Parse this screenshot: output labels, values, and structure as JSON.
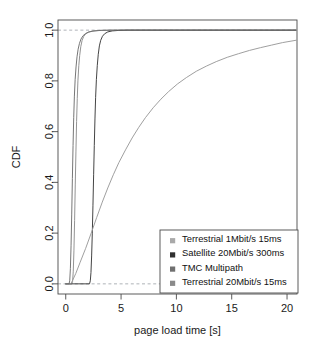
{
  "chart_data": {
    "type": "line",
    "title": "",
    "xlabel": "page load time [s]",
    "ylabel": "CDF",
    "xlim": [
      -0.7,
      20.9
    ],
    "ylim": [
      -0.04,
      1.04
    ],
    "xticks": [
      0,
      5,
      10,
      15,
      20
    ],
    "xtick_labels": [
      "0",
      "5",
      "10",
      "15",
      "20"
    ],
    "yticks": [
      0.0,
      0.2,
      0.4,
      0.6,
      0.8,
      1.0
    ],
    "ytick_labels": [
      "0.0",
      "0.2",
      "0.4",
      "0.6",
      "0.8",
      "1.0"
    ],
    "grid": false,
    "reference_lines": [
      {
        "name": "y-zero-dashed",
        "y": 0.0,
        "style": "dashed",
        "color": "#9aa0a6"
      },
      {
        "name": "y-one-dashed",
        "y": 1.0,
        "style": "dashed",
        "color": "#9aa0a6"
      }
    ],
    "legend_position": "bottom-right",
    "series": [
      {
        "name": "Terrestrial 1Mbit/s 15ms",
        "color": "#8d8d8d",
        "points": [
          [
            0.0,
            0.0
          ],
          [
            0.55,
            0.0
          ],
          [
            0.62,
            0.01
          ],
          [
            0.68,
            0.05
          ],
          [
            0.74,
            0.13
          ],
          [
            0.8,
            0.25
          ],
          [
            0.86,
            0.39
          ],
          [
            0.92,
            0.52
          ],
          [
            0.98,
            0.64
          ],
          [
            1.04,
            0.73
          ],
          [
            1.1,
            0.8
          ],
          [
            1.18,
            0.86
          ],
          [
            1.26,
            0.9
          ],
          [
            1.36,
            0.935
          ],
          [
            1.48,
            0.96
          ],
          [
            1.62,
            0.975
          ],
          [
            1.8,
            0.985
          ],
          [
            2.05,
            0.992
          ],
          [
            2.4,
            0.996
          ],
          [
            3.0,
            0.999
          ],
          [
            4.0,
            1.0
          ],
          [
            20.8,
            1.0
          ]
        ]
      },
      {
        "name": "Satellite 20Mbit/s 300ms",
        "color": "#3a3a3a",
        "points": [
          [
            0.0,
            0.0
          ],
          [
            2.15,
            0.0
          ],
          [
            2.22,
            0.012
          ],
          [
            2.28,
            0.045
          ],
          [
            2.34,
            0.11
          ],
          [
            2.4,
            0.2
          ],
          [
            2.46,
            0.31
          ],
          [
            2.52,
            0.43
          ],
          [
            2.58,
            0.545
          ],
          [
            2.64,
            0.65
          ],
          [
            2.7,
            0.735
          ],
          [
            2.77,
            0.805
          ],
          [
            2.85,
            0.86
          ],
          [
            2.94,
            0.905
          ],
          [
            3.04,
            0.938
          ],
          [
            3.16,
            0.96
          ],
          [
            3.32,
            0.976
          ],
          [
            3.52,
            0.986
          ],
          [
            3.8,
            0.993
          ],
          [
            4.2,
            0.997
          ],
          [
            4.8,
            0.999
          ],
          [
            5.6,
            1.0
          ],
          [
            20.8,
            1.0
          ]
        ]
      },
      {
        "name": "TMC Multipath",
        "color": "#9a9a9a",
        "points": [
          [
            0.0,
            0.0
          ],
          [
            0.45,
            0.0
          ],
          [
            0.6,
            0.012
          ],
          [
            0.9,
            0.04
          ],
          [
            1.3,
            0.085
          ],
          [
            1.8,
            0.14
          ],
          [
            2.3,
            0.2
          ],
          [
            2.8,
            0.262
          ],
          [
            3.3,
            0.322
          ],
          [
            3.8,
            0.378
          ],
          [
            4.3,
            0.43
          ],
          [
            4.8,
            0.478
          ],
          [
            5.4,
            0.528
          ],
          [
            6.0,
            0.575
          ],
          [
            6.6,
            0.617
          ],
          [
            7.2,
            0.655
          ],
          [
            7.9,
            0.694
          ],
          [
            8.6,
            0.728
          ],
          [
            9.3,
            0.758
          ],
          [
            10.1,
            0.788
          ],
          [
            10.9,
            0.813
          ],
          [
            11.8,
            0.838
          ],
          [
            12.7,
            0.858
          ],
          [
            13.6,
            0.876
          ],
          [
            14.6,
            0.893
          ],
          [
            15.6,
            0.907
          ],
          [
            16.6,
            0.92
          ],
          [
            17.6,
            0.931
          ],
          [
            18.6,
            0.941
          ],
          [
            19.6,
            0.951
          ],
          [
            20.8,
            0.96
          ]
        ]
      },
      {
        "name": "Terrestrial 20Mbit/s 15ms",
        "color": "#6f6f6f",
        "points": [
          [
            0.0,
            0.0
          ],
          [
            0.3,
            0.0
          ],
          [
            0.36,
            0.012
          ],
          [
            0.42,
            0.06
          ],
          [
            0.48,
            0.15
          ],
          [
            0.54,
            0.275
          ],
          [
            0.6,
            0.415
          ],
          [
            0.66,
            0.545
          ],
          [
            0.72,
            0.655
          ],
          [
            0.78,
            0.74
          ],
          [
            0.85,
            0.805
          ],
          [
            0.93,
            0.855
          ],
          [
            1.02,
            0.895
          ],
          [
            1.12,
            0.925
          ],
          [
            1.24,
            0.948
          ],
          [
            1.38,
            0.965
          ],
          [
            1.56,
            0.978
          ],
          [
            1.8,
            0.987
          ],
          [
            2.1,
            0.993
          ],
          [
            2.55,
            0.997
          ],
          [
            3.2,
            0.999
          ],
          [
            4.2,
            1.0
          ],
          [
            20.8,
            1.0
          ]
        ]
      }
    ],
    "legend": [
      {
        "label": "Terrestrial 1Mbit/s 15ms",
        "swatch_color": "#a9a9a9"
      },
      {
        "label": "Satellite 20Mbit/s 300ms",
        "swatch_color": "#303030"
      },
      {
        "label": "TMC Multipath",
        "swatch_color": "#707070"
      },
      {
        "label": "Terrestrial 20Mbit/s 15ms",
        "swatch_color": "#8a8a8a"
      }
    ]
  }
}
